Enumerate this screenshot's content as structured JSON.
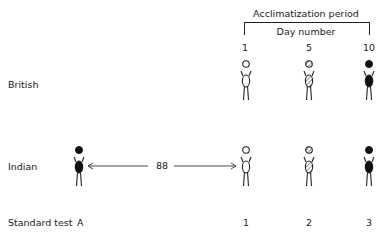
{
  "header": {
    "period_label": "Acclimatization period",
    "day_label": "Day number",
    "days": [
      "1",
      "5",
      "10"
    ]
  },
  "rows": [
    {
      "label": "British",
      "figures": [
        "open",
        "hatched",
        "filled"
      ]
    },
    {
      "label": "Indian",
      "figures": [
        "filled",
        "open",
        "hatched",
        "filled"
      ]
    }
  ],
  "arrow": {
    "label": "88"
  },
  "footer": {
    "label": "Standard test",
    "tests": [
      "A",
      "1",
      "2",
      "3"
    ]
  },
  "colors": {
    "ink": "#1a1a1a",
    "background": "#ffffff"
  }
}
